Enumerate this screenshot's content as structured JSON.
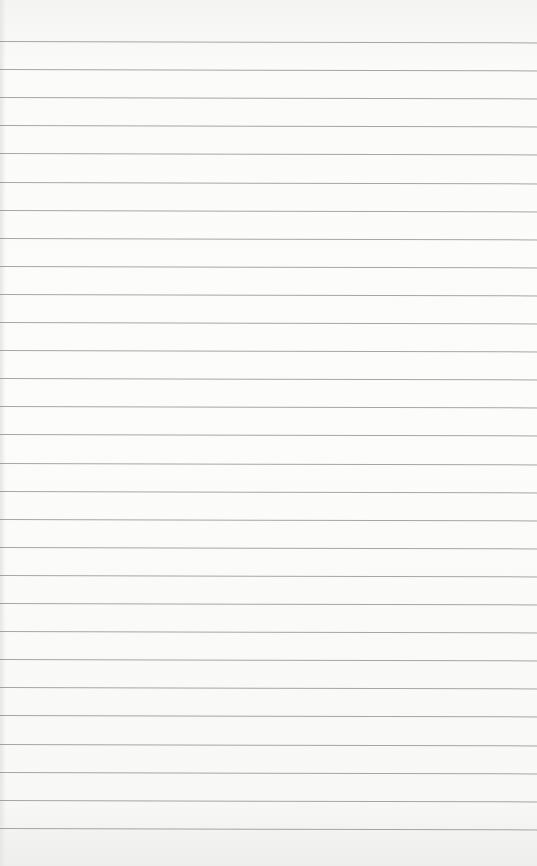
{
  "paper": {
    "background": "#fbfbfa",
    "rule_color": "#8a8a8a",
    "rule_count": 29,
    "first_rule_y": 41,
    "rule_spacing": 28.1
  }
}
